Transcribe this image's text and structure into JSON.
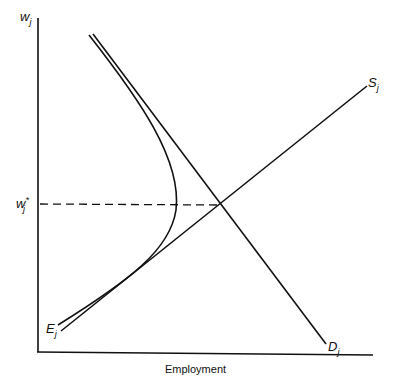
{
  "diagram": {
    "y_axis_label": {
      "base": "w",
      "sub": "j"
    },
    "x_axis_label": "Employment",
    "equilibrium_wage_label": {
      "base": "w",
      "sup": "*",
      "sub": "j"
    },
    "curves": {
      "supply": {
        "base": "S",
        "sub": "j"
      },
      "demand": {
        "base": "D",
        "sub": "j"
      },
      "effort": {
        "base": "E",
        "sub": "j"
      }
    },
    "colors": {
      "line": "#111111",
      "background": "#ffffff"
    }
  }
}
